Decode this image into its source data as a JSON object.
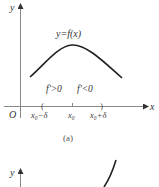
{
  "figure_a": {
    "y_axis_label": "y",
    "x_axis_label": "x",
    "origin_label": "O",
    "curve_label": "y=f(x)",
    "left_sign_label": "f'>0",
    "right_sign_label": "f'<0",
    "tick_labels": [
      "x₀−δ",
      "x₀",
      "x₀+δ"
    ],
    "caption": "(a)",
    "curve_color": "#222222",
    "axis_color": "#888888"
  },
  "figure_b": {
    "y_axis_label": "y"
  }
}
